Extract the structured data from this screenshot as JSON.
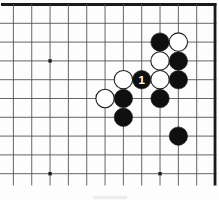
{
  "figure": {
    "kind": "go-board-diagram",
    "move_label": "1"
  },
  "board": {
    "visible_cols_from": 8,
    "visible_cols_to": 19,
    "visible_rows_from": 1,
    "visible_rows_to": 10,
    "thick_top_edge_row": 1,
    "thick_right_edge_col": 19,
    "star_points": [
      {
        "col": 10,
        "row": 4
      },
      {
        "col": 10,
        "row": 10
      },
      {
        "col": 16,
        "row": 10
      }
    ],
    "stones": [
      {
        "col": 16,
        "row": 3,
        "color": "black",
        "label": ""
      },
      {
        "col": 17,
        "row": 3,
        "color": "white",
        "label": ""
      },
      {
        "col": 16,
        "row": 4,
        "color": "white",
        "label": ""
      },
      {
        "col": 17,
        "row": 4,
        "color": "black",
        "label": ""
      },
      {
        "col": 14,
        "row": 5,
        "color": "white",
        "label": ""
      },
      {
        "col": 15,
        "row": 5,
        "color": "black",
        "label": "1"
      },
      {
        "col": 16,
        "row": 5,
        "color": "white",
        "label": ""
      },
      {
        "col": 17,
        "row": 5,
        "color": "black",
        "label": ""
      },
      {
        "col": 13,
        "row": 6,
        "color": "white",
        "label": ""
      },
      {
        "col": 14,
        "row": 6,
        "color": "black",
        "label": ""
      },
      {
        "col": 16,
        "row": 6,
        "color": "black",
        "label": ""
      },
      {
        "col": 14,
        "row": 7,
        "color": "black",
        "label": ""
      },
      {
        "col": 17,
        "row": 8,
        "color": "black",
        "label": ""
      }
    ],
    "colors": {
      "background": "#fdfdfd",
      "thin_line": "#555555",
      "edge_line": "#1a1a1a",
      "star_point": "#1f1f1f",
      "black_stone": "#0f0f0f",
      "white_stone": "#ffffff",
      "stone_outline": "#1f1f1f",
      "label_text": "#ffffff",
      "caption_remnant": "#ededed"
    }
  }
}
